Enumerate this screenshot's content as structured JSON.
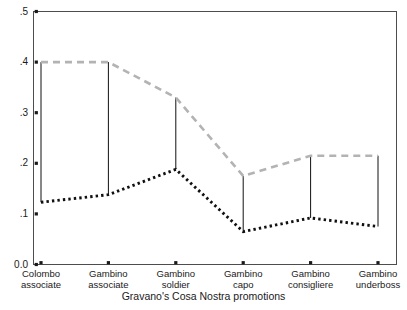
{
  "chart_data": {
    "type": "line",
    "title": "",
    "xlabel": "Gravano's Cosa Nostra promotions",
    "ylabel": "",
    "categories": [
      "Colombo associate",
      "Gambino associate",
      "Gambino soldier",
      "Gambino capo",
      "Gambino consigliere",
      "Gambino underboss"
    ],
    "category_lines": [
      [
        "Colombo",
        "associate"
      ],
      [
        "Gambino",
        "associate"
      ],
      [
        "Gambino",
        "soldier"
      ],
      [
        "Gambino",
        "capo"
      ],
      [
        "Gambino",
        "consigliere"
      ],
      [
        "Gambino",
        "underboss"
      ]
    ],
    "ylim": [
      0.0,
      0.5
    ],
    "ytick_labels": [
      "0.0",
      ".1",
      ".2",
      ".3",
      ".4",
      ".5"
    ],
    "ytick_values": [
      0.0,
      0.1,
      0.2,
      0.3,
      0.4,
      0.5
    ],
    "grid": false,
    "legend_position": "none",
    "series": [
      {
        "name": "upper-bound",
        "style": "dashed",
        "color": "#b3b3b3",
        "values": [
          0.4,
          0.4,
          0.33,
          0.175,
          0.215,
          0.215
        ]
      },
      {
        "name": "lower-bound",
        "style": "dotted",
        "color": "#101010",
        "values": [
          0.123,
          0.138,
          0.188,
          0.065,
          0.092,
          0.075
        ]
      }
    ],
    "connectors": {
      "name": "interval-bars",
      "color": "#101010",
      "pairs": [
        [
          0.123,
          0.4
        ],
        [
          0.138,
          0.4
        ],
        [
          0.188,
          0.33
        ],
        [
          0.065,
          0.175
        ],
        [
          0.092,
          0.215
        ],
        [
          0.075,
          0.215
        ]
      ]
    }
  },
  "axes": {
    "frame_color": "#4d4d4d",
    "tick_color": "#1a1a1a"
  }
}
